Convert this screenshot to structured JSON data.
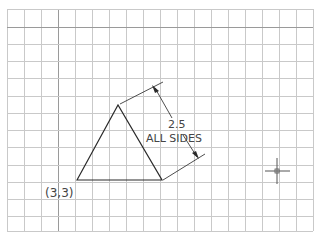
{
  "diagram": {
    "title": "",
    "grid": {
      "x_start": 7,
      "x_end": 313,
      "y_start": 9,
      "y_end": 231,
      "x_lines": [
        7,
        24,
        41,
        58,
        75,
        92,
        109,
        126,
        143,
        160,
        177,
        194,
        211,
        228,
        245,
        262,
        279,
        296,
        313
      ],
      "y_lines": [
        9,
        27,
        44,
        61,
        78,
        96,
        113,
        130,
        147,
        165,
        182,
        199,
        216,
        231
      ],
      "major_x": [
        58
      ],
      "major_y": [
        27
      ],
      "color": "#c9c9c9",
      "major_color": "#9a9a9a"
    },
    "triangle": {
      "points": [
        [
          77,
          180
        ],
        [
          118,
          105
        ],
        [
          162,
          180
        ]
      ],
      "label": "equilateral-triangle"
    },
    "dimension": {
      "value": "2.5",
      "note": "ALL SIDES"
    },
    "start_point_label": "(3,3)",
    "cursor": {
      "x": 277,
      "y": 171
    }
  }
}
